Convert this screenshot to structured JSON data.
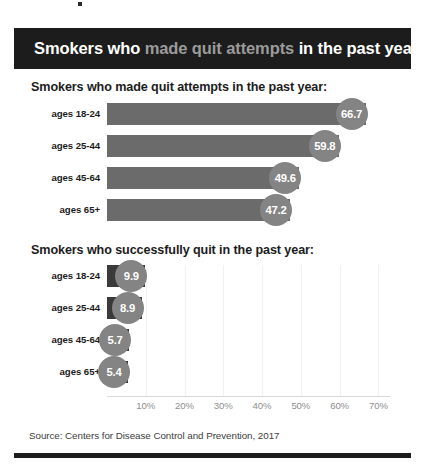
{
  "banner": {
    "part1": "Smokers who ",
    "part2": "made quit attempts",
    "part3": " in the past year",
    "bg_color": "#1c1c1c",
    "highlight_color": "#9b9b9b"
  },
  "sections": [
    {
      "heading": "Smokers who made quit attempts in the past year:"
    },
    {
      "heading": "Smokers who successfully quit in the past year:"
    }
  ],
  "footer": {
    "source": "Source: Centers for Disease Control and Prevention, 2017"
  },
  "axis": {
    "ticks": [
      "10%",
      "20%",
      "30%",
      "40%",
      "50%",
      "60%",
      "70%"
    ],
    "values": [
      10,
      20,
      30,
      40,
      50,
      60,
      70
    ]
  },
  "chart_data": [
    {
      "type": "bar",
      "title": "Smokers who made quit attempts in the past year:",
      "orientation": "horizontal",
      "categories": [
        "ages 18-24",
        "ages 25-44",
        "ages 45-64",
        "ages 65+"
      ],
      "values": [
        66.7,
        59.8,
        49.6,
        47.2
      ],
      "labels": [
        "66.7",
        "59.8",
        "49.6",
        "47.2"
      ],
      "xlabel": "",
      "ylabel": "",
      "xlim": [
        0,
        73
      ],
      "grid": true,
      "bar_color": "#6b6b6b",
      "bubble_color": "#848484"
    },
    {
      "type": "bar",
      "title": "Smokers who successfully quit in the past year:",
      "orientation": "horizontal",
      "categories": [
        "ages 18-24",
        "ages 25-44",
        "ages 45-64",
        "ages 65+"
      ],
      "values": [
        9.9,
        8.9,
        5.7,
        5.4
      ],
      "labels": [
        "9.9",
        "8.9",
        "5.7",
        "5.4"
      ],
      "xlabel": "",
      "ylabel": "",
      "xlim": [
        0,
        73
      ],
      "grid": true,
      "bar_color": "#3a3a3a",
      "bubble_color": "#848484"
    }
  ]
}
